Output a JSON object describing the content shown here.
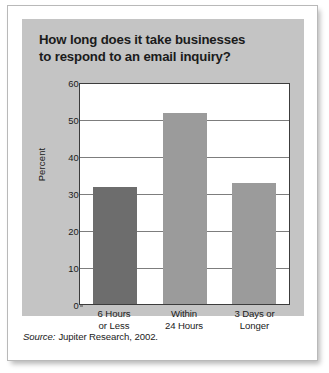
{
  "chart_data": {
    "type": "bar",
    "title": "How long does it take businesses to respond to an email inquiry?",
    "title_lines": [
      "How long does it take businesses",
      "to respond to an email inquiry?"
    ],
    "categories": [
      "6 Hours or Less",
      "Within 24 Hours",
      "3 Days or Longer"
    ],
    "category_lines": [
      [
        "6 Hours",
        "or Less"
      ],
      [
        "Within",
        "24 Hours"
      ],
      [
        "3 Days or",
        "Longer"
      ]
    ],
    "values": [
      32,
      52,
      33
    ],
    "xlabel": "",
    "ylabel": "Percent",
    "ylim": [
      0,
      60
    ],
    "yticks": [
      60,
      50,
      40,
      30,
      20,
      10,
      0
    ],
    "ytick_labels": [
      "60",
      "50",
      "40",
      "30",
      "20",
      "10",
      "0"
    ],
    "grid": true,
    "legend": false,
    "bar_colors": [
      "#6d6d6d",
      "#9b9b9b",
      "#9b9b9b"
    ]
  },
  "source": {
    "label": "Source:",
    "text": "Jupiter Research, 2002."
  },
  "colors": {
    "panel_background": "#c4c4c4",
    "card_background": "#ffffff",
    "plot_background": "#ffffff",
    "axis": "#3c3c3c",
    "gridline": "#7d7d7d",
    "text": "#1b1b1b",
    "bar_dark": "#6d6d6d",
    "bar_light": "#9b9b9b"
  }
}
